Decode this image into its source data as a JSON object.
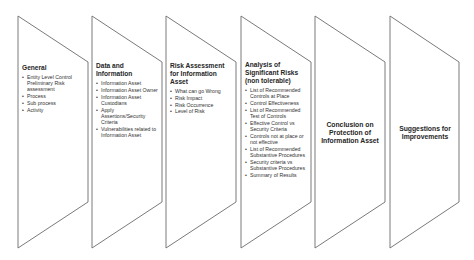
{
  "diagram": {
    "colors": {
      "stroke": "#6b6b6b",
      "text": "#2b2b2b",
      "background": "#ffffff"
    },
    "panels": [
      {
        "heading": "General",
        "items": [
          "Entity Level Control Preliminary Risk assessment",
          "Process",
          "Sub process",
          "Activity"
        ]
      },
      {
        "heading": "Data and Information",
        "items": [
          "Information Asset",
          "Information Asset Owner",
          "Information Asset Custodians",
          "Apply Assertions/Security Criteria",
          "Vulnerabilities related to Information Asset"
        ]
      },
      {
        "heading": "Risk Assessment for Information Asset",
        "items": [
          "What can go Wrong",
          "Risk Impact",
          "Risk Occurrence",
          "Level of Risk"
        ]
      },
      {
        "heading": "Analysis of Significant Risks (non tolerable)",
        "items": [
          "List of Recommended Controls at Place",
          "Control Effectiveness",
          "List of Recommended Test of Controls",
          "Effective Control vs Security Criteria",
          "Controls not at place or not effective",
          "List of Recommended Substantive Procedures",
          "Security criteria vs Substantive Procedures",
          "Summary of Results"
        ]
      },
      {
        "heading": "Conclusion on Protection of Information Asset",
        "items": []
      },
      {
        "heading": "Suggestions for Improvements",
        "items": []
      }
    ]
  }
}
